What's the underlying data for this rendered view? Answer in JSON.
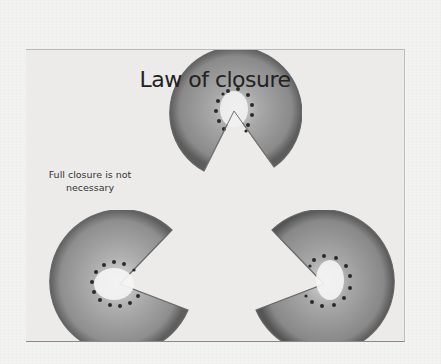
{
  "slide": {
    "title": "Law of closure",
    "note": "Full closure is not necessary",
    "figure": {
      "description": "Three kiwi slices with wedges cut out, arranged to imply a white triangle",
      "items": [
        "kiwi-slice-top",
        "kiwi-slice-bottom-left",
        "kiwi-slice-bottom-right"
      ]
    }
  },
  "colors": {
    "page": "#f3f3f2",
    "slide": "#ecebea",
    "kiwi_flesh": "#8e8e8e",
    "kiwi_core": "#f4f4f4",
    "seeds": "#2a2a2a",
    "text": "#222222"
  }
}
